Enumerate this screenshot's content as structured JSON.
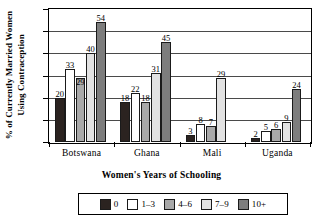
{
  "chart_data": {
    "type": "bar",
    "title": "",
    "xlabel": "",
    "ylabel": "% of Currently Married Women Using Contraception",
    "ylabel_lines": [
      "% of Currently Married Women",
      "Using Contraception"
    ],
    "categories": [
      "Botswana",
      "Ghana",
      "Mali",
      "Uganda"
    ],
    "ylim": [
      0,
      60
    ],
    "yticks": [
      0,
      10,
      20,
      30,
      40,
      50,
      60
    ],
    "ytick_labels": [
      "0",
      "10",
      "20",
      "30",
      "40",
      "50",
      "60"
    ],
    "grid": true,
    "grid_axis": "y",
    "legend_position": "bottom",
    "legend_title": "Women's Years of Schooling",
    "series": [
      {
        "name": "0",
        "color": "#2b2320",
        "values": [
          20,
          18,
          3,
          2
        ]
      },
      {
        "name": "1–3",
        "color": "#ffffff",
        "values": [
          33,
          22,
          8,
          5
        ]
      },
      {
        "name": "4–6",
        "color": "#a9a9a9",
        "values": [
          29,
          18,
          7,
          6
        ]
      },
      {
        "name": "7–9",
        "color": "#e2e2e2",
        "values": [
          40,
          31,
          29,
          9
        ]
      },
      {
        "name": "10+",
        "color": "#7d7d7d",
        "values": [
          54,
          45,
          null,
          24
        ]
      }
    ],
    "value_labels": {
      "Botswana": [
        "20",
        "33",
        "29",
        "40",
        "54"
      ],
      "Ghana": [
        "18",
        "22",
        "18",
        "31",
        "45"
      ],
      "Mali": [
        "3",
        "8",
        "7",
        "29",
        ""
      ],
      "Uganda": [
        "2",
        "5",
        "6",
        "9",
        "24"
      ]
    }
  },
  "legend": {
    "title": "Women's Years of Schooling",
    "items": [
      {
        "label": "0",
        "color": "#2b2320"
      },
      {
        "label": "1–3",
        "color": "#ffffff"
      },
      {
        "label": "4–6",
        "color": "#a9a9a9"
      },
      {
        "label": "7–9",
        "color": "#e2e2e2"
      },
      {
        "label": "10+",
        "color": "#7d7d7d"
      }
    ]
  },
  "axes": {
    "y_title_line1": "% of Currently Married Women",
    "y_title_line2": "Using Contraception",
    "y_ticks": [
      "60",
      "50",
      "40",
      "30",
      "20",
      "10",
      "0"
    ],
    "x_categories": [
      "Botswana",
      "Ghana",
      "Mali",
      "Uganda"
    ]
  }
}
